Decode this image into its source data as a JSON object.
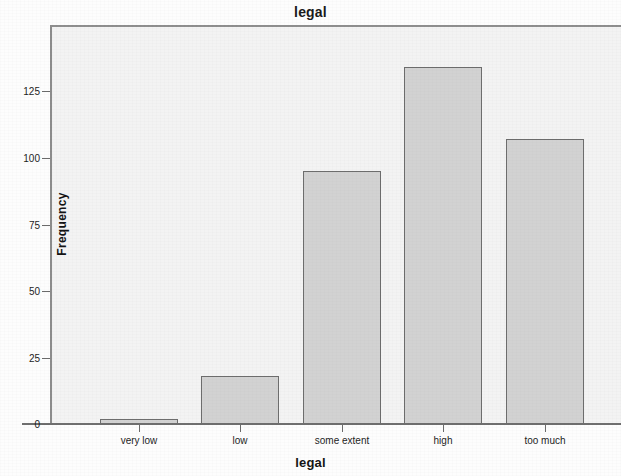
{
  "chart_data": {
    "type": "bar",
    "title": "legal",
    "xlabel": "legal",
    "ylabel": "Frequency",
    "categories": [
      "very low",
      "low",
      "some extent",
      "high",
      "too much"
    ],
    "values": [
      2,
      18,
      95,
      134,
      107
    ],
    "ylim": [
      0,
      140
    ],
    "yticks": [
      0,
      25,
      50,
      75,
      100,
      125
    ],
    "ytick_labels": [
      "0",
      "25",
      "50",
      "75",
      "100",
      "125"
    ],
    "grid": false,
    "legend": null,
    "series": [
      {
        "name": "Frequency",
        "values": [
          2,
          18,
          95,
          134,
          107
        ]
      }
    ],
    "colors": {
      "bar_fill": "#d2d2d2",
      "bar_border": "#6d6d6d",
      "plot_background": "#f3f3f3",
      "axis": "#6b6b6b",
      "text": "#1d1d1d"
    }
  }
}
